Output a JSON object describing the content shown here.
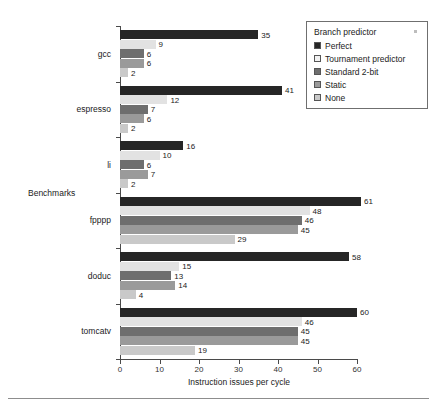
{
  "chart_data": {
    "type": "bar",
    "orientation": "horizontal",
    "title": "",
    "xlabel": "Instruction issues per cycle",
    "ylabel": "Benchmarks",
    "xlim": [
      0,
      60
    ],
    "xticks": [
      0,
      10,
      20,
      30,
      40,
      50,
      60
    ],
    "grid": false,
    "legend_title": "Branch predictor",
    "legend_position": "top-right",
    "categories": [
      "gcc",
      "espresso",
      "li",
      "fpppp",
      "doduc",
      "tomcatv"
    ],
    "series": [
      {
        "name": "Perfect",
        "color": "#262626",
        "values": [
          35,
          41,
          16,
          61,
          58,
          60
        ]
      },
      {
        "name": "Tournament predictor",
        "color": "#e2e2e2",
        "values": [
          9,
          12,
          10,
          48,
          15,
          46
        ]
      },
      {
        "name": "Standard 2-bit",
        "color": "#6e6e6e",
        "values": [
          6,
          7,
          6,
          46,
          13,
          45
        ]
      },
      {
        "name": "Static",
        "color": "#9a9a9a",
        "values": [
          6,
          6,
          7,
          45,
          14,
          45
        ]
      },
      {
        "name": "None",
        "color": "#c9c9c9",
        "values": [
          2,
          2,
          2,
          29,
          4,
          19
        ]
      }
    ]
  },
  "legend": {
    "title": "Branch predictor",
    "items": [
      {
        "label": "Perfect",
        "color": "#262626"
      },
      {
        "label": "Tournament predictor",
        "color": "#f2f2f2"
      },
      {
        "label": "Standard 2-bit",
        "color": "#6e6e6e"
      },
      {
        "label": "Static",
        "color": "#9a9a9a"
      },
      {
        "label": "None",
        "color": "#c9c9c9"
      }
    ]
  },
  "axes": {
    "x_title": "Instruction issues per cycle",
    "y_title": "Benchmarks",
    "x_tick_labels": [
      "0",
      "10",
      "20",
      "30",
      "40",
      "50",
      "60"
    ]
  }
}
